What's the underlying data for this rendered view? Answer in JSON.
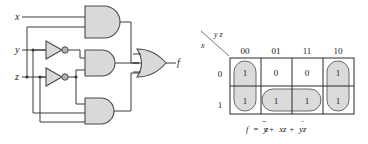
{
  "figure": {
    "circuit": {
      "inputs": [
        {
          "name": "x",
          "label": "x"
        },
        {
          "name": "y",
          "label": "y"
        },
        {
          "name": "z",
          "label": "z"
        }
      ],
      "output": {
        "name": "f",
        "label": "f"
      },
      "gates": [
        {
          "id": "and-top",
          "type": "AND",
          "inputs": 2,
          "term": "x z"
        },
        {
          "id": "and-middle",
          "type": "AND",
          "inputs": 2,
          "term": "y' z'"
        },
        {
          "id": "and-bottom",
          "type": "AND",
          "inputs": 2,
          "term": "y z'"
        },
        {
          "id": "or-output",
          "type": "OR",
          "inputs": 3
        },
        {
          "id": "inverter-y",
          "type": "NOT",
          "inputs": 1
        },
        {
          "id": "inverter-z",
          "type": "NOT",
          "inputs": 1
        }
      ]
    },
    "kmap": {
      "row_variable": "x",
      "col_variable": "y z",
      "col_headers": [
        "00",
        "01",
        "11",
        "10"
      ],
      "row_headers": [
        "0",
        "1"
      ],
      "cells": [
        [
          "1",
          "0",
          "0",
          "1"
        ],
        [
          "1",
          "1",
          "1",
          "1"
        ]
      ],
      "groups": [
        {
          "name": "group-col-00",
          "orientation": "vertical",
          "cells": "col 00, rows 0-1",
          "term": "y' z'"
        },
        {
          "name": "group-col-10",
          "orientation": "vertical",
          "cells": "col 10, rows 0-1",
          "term": "y z'"
        },
        {
          "name": "group-row-1-middle",
          "orientation": "horizontal",
          "cells": "row 1, cols 01 and 11",
          "term": "x z"
        }
      ],
      "equation": {
        "lhs": "f",
        "eq": "=",
        "terms": [
          {
            "vars": [
              {
                "v": "y",
                "bar": true
              },
              {
                "v": "z",
                "bar": true
              }
            ]
          },
          {
            "vars": [
              {
                "v": "x",
                "bar": false
              },
              {
                "v": "z",
                "bar": false
              }
            ]
          },
          {
            "vars": [
              {
                "v": "y",
                "bar": false
              },
              {
                "v": "z",
                "bar": true
              }
            ]
          }
        ],
        "plain": "f = y'z' + xz + yz'"
      }
    }
  },
  "colors": {
    "gate_fill": "#d9d9d9",
    "wire": "#3a3a3a",
    "group_fill": "#d5d5d5",
    "grid": "#2a2a2a"
  }
}
